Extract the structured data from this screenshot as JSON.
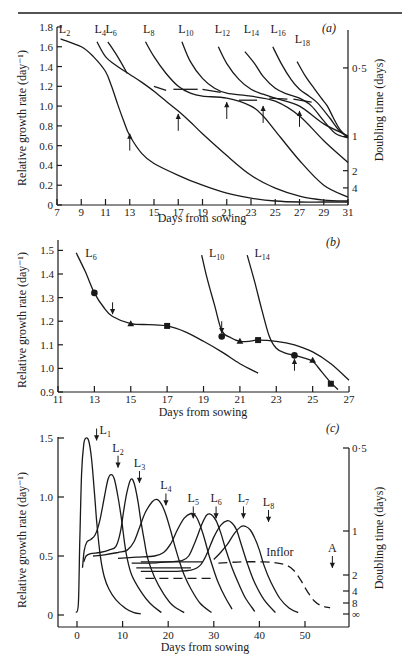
{
  "chart_data": [
    {
      "panel": "(a)",
      "type": "line",
      "title": "",
      "xlabel": "Days from sowing",
      "ylabel": "Relative growth rate (day⁻¹)",
      "ylabel_right": "Doubling time (days)",
      "xlim": [
        7,
        31
      ],
      "ylim": [
        0,
        1.8
      ],
      "x_ticks": [
        7,
        9,
        11,
        13,
        15,
        17,
        19,
        21,
        23,
        25,
        27,
        29,
        31
      ],
      "y_ticks": [
        "0",
        "0.2",
        "0.4",
        "0.6",
        "0.8",
        "1.0",
        "1.2",
        "1.4",
        "1.6",
        "1.8"
      ],
      "y_ticks_values": [
        0,
        0.2,
        0.4,
        0.6,
        0.8,
        1.0,
        1.2,
        1.4,
        1.6,
        1.8
      ],
      "right_ticks": [
        {
          "label": "0·5",
          "value": 1.386
        },
        {
          "label": "1",
          "value": 0.693
        },
        {
          "label": "2",
          "value": 0.347
        },
        {
          "label": "4",
          "value": 0.173
        }
      ],
      "series": [
        {
          "name": "L2",
          "x": [
            7.3,
            9,
            10,
            11,
            11.5,
            12,
            12.5,
            13,
            14,
            15,
            17,
            19,
            21,
            23,
            25,
            27,
            29,
            31
          ],
          "values": [
            1.68,
            1.6,
            1.5,
            1.35,
            1.2,
            1.02,
            0.85,
            0.7,
            0.52,
            0.42,
            0.3,
            0.2,
            0.12,
            0.07,
            0.04,
            0.03,
            0.03,
            0.03
          ]
        },
        {
          "name": "L4",
          "x": [
            10.3,
            11,
            12,
            13,
            14,
            15,
            16,
            17,
            18,
            19,
            21,
            23,
            25,
            27,
            29,
            31
          ],
          "values": [
            1.65,
            1.5,
            1.4,
            1.32,
            1.24,
            1.15,
            1.05,
            0.95,
            0.84,
            0.72,
            0.5,
            0.3,
            0.17,
            0.09,
            0.05,
            0.04
          ]
        },
        {
          "name": "L6",
          "x": [
            11.2,
            12,
            12.8
          ],
          "values": [
            1.65,
            1.5,
            1.33
          ]
        },
        {
          "name": "L8",
          "x": [
            14.3,
            15,
            16,
            17,
            18,
            19,
            21,
            23,
            24,
            25,
            27,
            29,
            31
          ],
          "values": [
            1.65,
            1.5,
            1.33,
            1.2,
            1.13,
            1.1,
            1.08,
            1.0,
            0.9,
            0.75,
            0.45,
            0.2,
            0.08
          ]
        },
        {
          "name": "L10",
          "x": [
            17.3,
            18,
            19,
            20,
            21,
            23,
            25,
            27,
            29,
            31
          ],
          "values": [
            1.65,
            1.45,
            1.28,
            1.18,
            1.13,
            1.1,
            1.05,
            0.9,
            0.65,
            0.43
          ]
        },
        {
          "name": "L12",
          "x": [
            20.3,
            21,
            22,
            23,
            24,
            25,
            27,
            29,
            31
          ],
          "values": [
            1.6,
            1.43,
            1.27,
            1.17,
            1.12,
            1.08,
            1.0,
            0.82,
            0.7
          ]
        },
        {
          "name": "L14",
          "x": [
            22.5,
            23.3,
            24,
            25,
            26,
            27,
            28,
            29,
            30,
            31
          ],
          "values": [
            1.55,
            1.43,
            1.3,
            1.18,
            1.12,
            1.08,
            1.0,
            0.85,
            0.72,
            0.68
          ]
        },
        {
          "name": "L16",
          "x": [
            24.8,
            25.5,
            26.3,
            27,
            27.8,
            28.5,
            29.5,
            30.3,
            31
          ],
          "values": [
            1.6,
            1.43,
            1.27,
            1.17,
            1.1,
            1.03,
            0.88,
            0.75,
            0.69
          ]
        },
        {
          "name": "L18",
          "x": [
            26.8,
            27.5,
            28.2,
            28.8,
            29.3,
            29.8,
            30.3,
            31
          ],
          "values": [
            1.45,
            1.3,
            1.18,
            1.08,
            1.0,
            0.88,
            0.77,
            0.68
          ]
        }
      ],
      "dashed_segments": [
        {
          "x": [
            15.0,
            16.0
          ],
          "values": [
            1.2,
            1.16
          ]
        },
        {
          "x": [
            16.6,
            18.6
          ],
          "values": [
            1.17,
            1.17
          ]
        },
        {
          "x": [
            19.0,
            20.5
          ],
          "values": [
            1.17,
            1.14
          ]
        },
        {
          "x": [
            22.0,
            23.5
          ],
          "values": [
            1.06,
            1.06
          ]
        },
        {
          "x": [
            24.5,
            26.0
          ],
          "values": [
            1.08,
            1.07
          ]
        },
        {
          "x": [
            26.5,
            28.0
          ],
          "values": [
            1.07,
            1.04
          ]
        }
      ],
      "arrows": [
        {
          "x": 13,
          "y_from": 0.55,
          "y_to": 0.72
        },
        {
          "x": 17,
          "y_from": 0.75,
          "y_to": 0.92
        },
        {
          "x": 21,
          "y_from": 0.87,
          "y_to": 1.04
        },
        {
          "x": 24,
          "y_from": 0.83,
          "y_to": 1.0
        },
        {
          "x": 27,
          "y_from": 0.79,
          "y_to": 0.95
        }
      ]
    },
    {
      "panel": "(b)",
      "type": "line",
      "title": "",
      "xlabel": "Days from sowing",
      "ylabel": "Relative growth rate (day⁻¹)",
      "xlim": [
        11,
        27
      ],
      "ylim": [
        0.9,
        1.5
      ],
      "x_ticks": [
        11,
        13,
        15,
        17,
        19,
        21,
        23,
        25,
        27
      ],
      "y_ticks": [
        "0.9",
        "1.0",
        "1.1",
        "1.2",
        "1.3",
        "1.4",
        "1.5"
      ],
      "y_ticks_values": [
        0.9,
        1.0,
        1.1,
        1.2,
        1.3,
        1.4,
        1.5
      ],
      "series": [
        {
          "name": "L6",
          "x": [
            12.0,
            12.5,
            13.0,
            13.5,
            14.0,
            15.0,
            16.0,
            17.0,
            18.0,
            19.0,
            20.0,
            21.0,
            22.0
          ],
          "values": [
            1.49,
            1.41,
            1.32,
            1.26,
            1.22,
            1.19,
            1.185,
            1.18,
            1.155,
            1.115,
            1.07,
            1.02,
            0.98
          ]
        },
        {
          "name": "L10",
          "x": [
            18.9,
            19.2,
            19.6,
            20.0,
            20.5,
            21.0,
            21.5,
            22.0,
            23.0,
            24.0,
            25.0,
            26.0,
            27.0
          ],
          "values": [
            1.48,
            1.38,
            1.27,
            1.16,
            1.13,
            1.115,
            1.115,
            1.12,
            1.115,
            1.1,
            1.07,
            1.02,
            0.95
          ]
        },
        {
          "name": "L14",
          "x": [
            21.4,
            21.8,
            22.2,
            22.6,
            23.0,
            23.5,
            24.0,
            24.5,
            25.0,
            25.5,
            26.0,
            26.4
          ],
          "values": [
            1.48,
            1.37,
            1.25,
            1.14,
            1.085,
            1.065,
            1.055,
            1.045,
            1.03,
            0.985,
            0.94,
            0.91
          ]
        }
      ],
      "markers": [
        {
          "shape": "circle",
          "x": 13,
          "value": 1.32
        },
        {
          "shape": "triangle",
          "x": 15,
          "value": 1.19
        },
        {
          "shape": "square",
          "x": 17,
          "value": 1.18
        },
        {
          "shape": "circle",
          "x": 20,
          "value": 1.135
        },
        {
          "shape": "triangle",
          "x": 21,
          "value": 1.115
        },
        {
          "shape": "square",
          "x": 22,
          "value": 1.12
        },
        {
          "shape": "circle",
          "x": 24,
          "value": 1.055
        },
        {
          "shape": "triangle",
          "x": 25,
          "value": 1.035
        },
        {
          "shape": "square",
          "x": 26,
          "value": 0.935
        }
      ],
      "arrows": [
        {
          "x": 14,
          "direction": "down",
          "y_from": 1.28,
          "y_to": 1.23
        },
        {
          "x": 20,
          "direction": "down",
          "y_from": 1.2,
          "y_to": 1.15
        },
        {
          "x": 24,
          "direction": "up",
          "y_from": 0.99,
          "y_to": 1.04
        }
      ]
    },
    {
      "panel": "(c)",
      "type": "line",
      "title": "",
      "xlabel": "Days from sowing",
      "ylabel": "Relative growth rate (day⁻¹)",
      "ylabel_right": "Doubling time (days)",
      "xlim": [
        -4,
        60
      ],
      "ylim": [
        0,
        1.5
      ],
      "x_ticks": [
        0,
        10,
        20,
        30,
        40,
        50
      ],
      "y_ticks": [
        "0",
        "0.5",
        "1.0",
        "1.5"
      ],
      "y_ticks_values": [
        0,
        0.5,
        1.0,
        1.5
      ],
      "right_ticks": [
        {
          "label": "0·5",
          "value": 1.386
        },
        {
          "label": "1",
          "value": 0.693
        },
        {
          "label": "2",
          "value": 0.347
        },
        {
          "label": "4",
          "value": 0.173
        },
        {
          "label": "8",
          "value": 0.087
        },
        {
          "label": "∞",
          "value": 0.0
        }
      ],
      "series": [
        {
          "name": "L1",
          "x": [
            -0.2,
            0.3,
            0.6,
            1.0,
            1.5,
            2.0,
            2.6,
            3.2,
            3.8,
            4.3,
            4.8,
            5.3,
            6.0,
            7.0,
            8.5,
            10.5,
            12.5,
            14.0
          ],
          "values": [
            0.02,
            0.1,
            0.6,
            1.2,
            1.45,
            1.5,
            1.47,
            1.32,
            1.05,
            0.8,
            0.6,
            0.45,
            0.32,
            0.22,
            0.13,
            0.06,
            0.02,
            0.01
          ]
        },
        {
          "name": "L2",
          "x": [
            1.2,
            1.6,
            2.2,
            3.0,
            4.0,
            5.0,
            6.0,
            6.8,
            7.5,
            8.2,
            9.0,
            9.8,
            10.4,
            11.0,
            12.0,
            14.0,
            16.0,
            18.5
          ],
          "values": [
            0.4,
            0.55,
            0.62,
            0.64,
            0.68,
            0.8,
            1.0,
            1.15,
            1.19,
            1.15,
            1.0,
            0.8,
            0.62,
            0.48,
            0.34,
            0.2,
            0.1,
            0.02
          ]
        },
        {
          "name": "L3",
          "x": [
            1.5,
            2.0,
            3.0,
            5.0,
            7.0,
            8.5,
            9.5,
            10.3,
            11.0,
            11.8,
            12.5,
            13.3,
            14.0,
            14.8,
            15.5,
            17.0,
            19.0,
            21.0,
            23.5
          ],
          "values": [
            0.45,
            0.5,
            0.52,
            0.53,
            0.55,
            0.58,
            0.7,
            0.9,
            1.05,
            1.15,
            1.12,
            0.98,
            0.8,
            0.62,
            0.48,
            0.32,
            0.18,
            0.08,
            0.02
          ]
        },
        {
          "name": "L4",
          "x": [
            3.5,
            6.0,
            9.0,
            11.0,
            12.5,
            13.8,
            15.0,
            16.5,
            17.5,
            18.5,
            19.5,
            20.5,
            21.5,
            22.5,
            23.5,
            25.0,
            27.0,
            29.5
          ],
          "values": [
            0.5,
            0.51,
            0.53,
            0.55,
            0.62,
            0.75,
            0.87,
            0.96,
            0.98,
            0.94,
            0.85,
            0.72,
            0.58,
            0.45,
            0.34,
            0.22,
            0.1,
            0.02
          ]
        },
        {
          "name": "L5",
          "x": [
            9.0,
            13.0,
            17.0,
            19.0,
            20.5,
            22.0,
            23.5,
            25.0,
            26.0,
            27.0,
            28.0,
            29.0,
            30.0,
            31.0,
            32.5,
            34.0
          ],
          "values": [
            0.48,
            0.49,
            0.5,
            0.53,
            0.6,
            0.72,
            0.82,
            0.86,
            0.84,
            0.76,
            0.64,
            0.5,
            0.38,
            0.27,
            0.15,
            0.05
          ]
        },
        {
          "name": "L6",
          "x": [
            12.0,
            16.0,
            20.0,
            23.0,
            24.5,
            26.0,
            27.5,
            28.5,
            29.5,
            30.5,
            31.5,
            32.5,
            34.0,
            35.5,
            37.0,
            39.0
          ],
          "values": [
            0.44,
            0.44,
            0.45,
            0.46,
            0.5,
            0.63,
            0.78,
            0.85,
            0.85,
            0.8,
            0.7,
            0.57,
            0.4,
            0.26,
            0.14,
            0.03
          ]
        },
        {
          "name": "L7",
          "x": [
            14.0,
            18.0,
            22.0,
            25.0,
            27.0,
            28.5,
            30.0,
            31.5,
            33.0,
            34.0,
            35.0,
            36.0,
            37.5,
            39.0,
            41.0,
            43.5
          ],
          "values": [
            0.37,
            0.37,
            0.37,
            0.38,
            0.42,
            0.52,
            0.66,
            0.76,
            0.8,
            0.78,
            0.72,
            0.6,
            0.42,
            0.27,
            0.13,
            0.02
          ]
        },
        {
          "name": "L8",
          "x": [
            30.0,
            31.5,
            33.0,
            34.5,
            36.0,
            37.0,
            38.0,
            39.0,
            40.0,
            41.0,
            42.5,
            44.5,
            46.5,
            48.5
          ],
          "values": [
            0.47,
            0.53,
            0.6,
            0.69,
            0.75,
            0.75,
            0.72,
            0.65,
            0.55,
            0.42,
            0.28,
            0.14,
            0.06,
            0.02
          ]
        }
      ],
      "dashed_segments": [
        {
          "name": "under-L8",
          "x": [
            15.0,
            29.5
          ],
          "values": [
            0.31,
            0.31
          ]
        },
        {
          "name": "Inflor",
          "x": [
            31.0,
            36.0,
            41.0,
            44.0,
            46.0,
            47.5,
            49.0,
            50.5,
            52.0,
            53.5,
            55.5
          ],
          "values": [
            0.44,
            0.45,
            0.45,
            0.44,
            0.42,
            0.38,
            0.3,
            0.2,
            0.12,
            0.08,
            0.06
          ]
        }
      ],
      "down_arrows": [
        {
          "label": "L1",
          "x": 4.3,
          "y_from": 1.58,
          "y_to": 1.48
        },
        {
          "label": "L2",
          "x": 9.0,
          "y_from": 1.35,
          "y_to": 1.25
        },
        {
          "label": "L3",
          "x": 13.7,
          "y_from": 1.22,
          "y_to": 1.12
        },
        {
          "label": "L4",
          "x": 19.5,
          "y_from": 1.03,
          "y_to": 0.93
        },
        {
          "label": "L5",
          "x": 25.5,
          "y_from": 0.92,
          "y_to": 0.82
        },
        {
          "label": "L6",
          "x": 30.5,
          "y_from": 0.92,
          "y_to": 0.82
        },
        {
          "label": "L7",
          "x": 36.5,
          "y_from": 0.92,
          "y_to": 0.82
        },
        {
          "label": "L8",
          "x": 42.0,
          "y_from": 0.89,
          "y_to": 0.79
        },
        {
          "label": "A",
          "x": 56.0,
          "y_from": 0.5,
          "y_to": 0.4
        }
      ],
      "annotations": [
        {
          "text": "Inflor",
          "x": 41.5,
          "value": 0.5
        }
      ]
    }
  ],
  "panels": {
    "a": {
      "label": "(a)",
      "xlabel": "Days from sowing",
      "ylabel": "Relative growth rate (day⁻¹)",
      "ylabel_right": "Doubling time (days)"
    },
    "b": {
      "label": "(b)",
      "xlabel": "Days from sowing",
      "ylabel": "Relative growth rate (day⁻¹)"
    },
    "c": {
      "label": "(c)",
      "xlabel": "Days from sowing",
      "ylabel": "Relative growth rate (day⁻¹)",
      "ylabel_right": "Doubling time (days)",
      "inflor_label": "Inflor",
      "arrow_A_label": "A"
    }
  }
}
